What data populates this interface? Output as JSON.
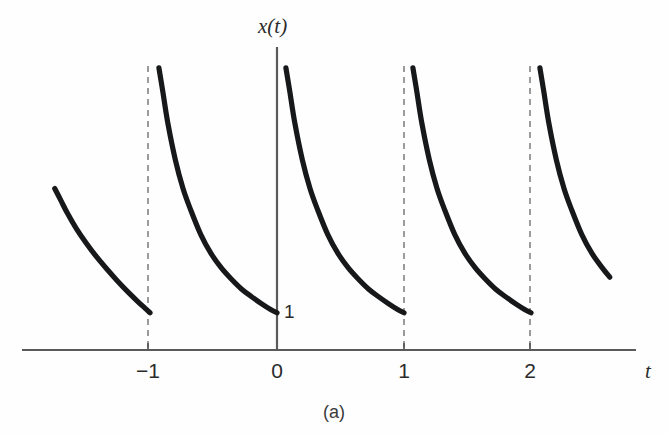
{
  "figure": {
    "caption": "(a)",
    "background_color": "#fefefe"
  },
  "chart_data": {
    "type": "line",
    "title": "",
    "subtitle": "",
    "xlabel": "t",
    "ylabel": "x(t)",
    "xlim": [
      -1.75,
      2.65
    ],
    "ylim": [
      0,
      8.2
    ],
    "grid": false,
    "legend": null,
    "period": 1,
    "minimum_value": 1,
    "x_ticks": [
      -1,
      0,
      1,
      2
    ],
    "x_tick_labels": [
      "−1",
      "0",
      "1",
      "2"
    ],
    "y_ticks": [
      1
    ],
    "y_tick_labels": [
      "1"
    ],
    "annotations": [
      {
        "text": "1",
        "x": 0.06,
        "y": 1,
        "note": "minimum level of the waveform marked on the vertical axis"
      }
    ],
    "asymptotes": {
      "style": "dashed",
      "color": "#8a8a8a",
      "x_values": [
        -1,
        1,
        2
      ]
    },
    "series": [
      {
        "name": "x(t)",
        "color": "#17181a",
        "line_width": 5.2,
        "segments": [
          {
            "label": "partial-period-left",
            "x": [
              -1.75,
              -1.7,
              -1.65,
              -1.58,
              -1.5,
              -1.42,
              -1.34,
              -1.26,
              -1.18,
              -1.1,
              -1.04,
              -1.0
            ],
            "y": [
              4.55,
              4.2,
              3.85,
              3.42,
              3.0,
              2.62,
              2.28,
              1.96,
              1.66,
              1.38,
              1.18,
              1.05
            ]
          },
          {
            "label": "period--1-to-0",
            "x": [
              -0.93,
              -0.9,
              -0.86,
              -0.8,
              -0.74,
              -0.68,
              -0.6,
              -0.52,
              -0.44,
              -0.36,
              -0.28,
              -0.2,
              -0.12,
              -0.05,
              0.0
            ],
            "y": [
              7.95,
              7.3,
              6.4,
              5.35,
              4.55,
              3.95,
              3.25,
              2.72,
              2.32,
              2.0,
              1.72,
              1.5,
              1.3,
              1.14,
              1.05
            ]
          },
          {
            "label": "period-0-to-1",
            "x": [
              0.07,
              0.1,
              0.14,
              0.2,
              0.26,
              0.32,
              0.4,
              0.48,
              0.56,
              0.64,
              0.72,
              0.8,
              0.88,
              0.95,
              1.0
            ],
            "y": [
              7.95,
              7.3,
              6.4,
              5.35,
              4.55,
              3.95,
              3.25,
              2.72,
              2.32,
              2.0,
              1.72,
              1.5,
              1.3,
              1.14,
              1.05
            ]
          },
          {
            "label": "period-1-to-2",
            "x": [
              1.07,
              1.1,
              1.14,
              1.2,
              1.26,
              1.32,
              1.4,
              1.48,
              1.56,
              1.64,
              1.72,
              1.8,
              1.88,
              1.95,
              2.0
            ],
            "y": [
              7.95,
              7.3,
              6.4,
              5.35,
              4.55,
              3.95,
              3.25,
              2.72,
              2.32,
              2.0,
              1.72,
              1.5,
              1.3,
              1.14,
              1.05
            ]
          },
          {
            "label": "partial-period-right",
            "x": [
              2.07,
              2.1,
              2.14,
              2.2,
              2.26,
              2.32,
              2.4,
              2.48,
              2.56,
              2.62
            ],
            "y": [
              7.95,
              7.3,
              6.4,
              5.35,
              4.55,
              3.95,
              3.25,
              2.72,
              2.32,
              2.05
            ]
          }
        ]
      }
    ]
  }
}
